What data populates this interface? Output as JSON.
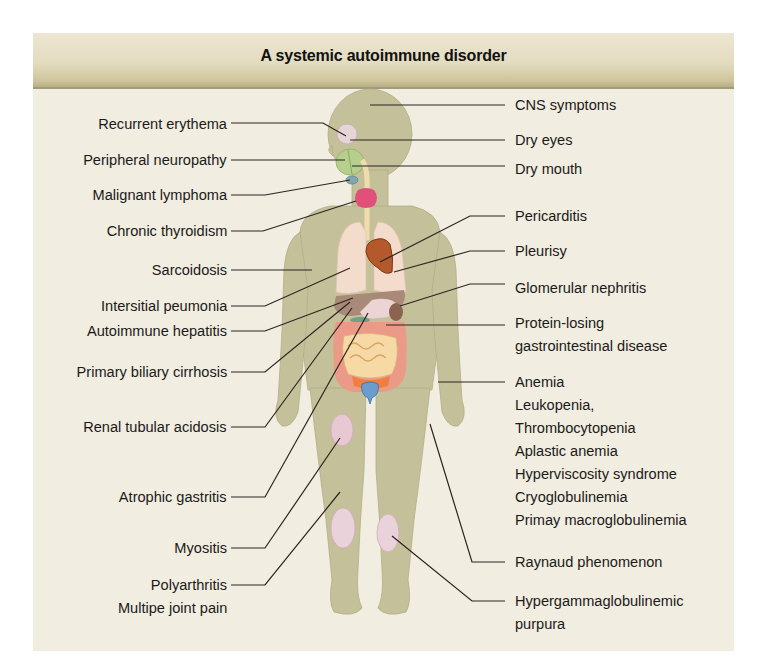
{
  "title": "A systemic autoimmune disorder",
  "colors": {
    "panel_bg": "#f1ede0",
    "header_band": "#e3dcc0",
    "body_skin": "#c4c09a",
    "lungs": "#f3dccb",
    "heart": "#b4592c",
    "thyroid": "#e0507a",
    "salivary_gland": "#b7cf8c",
    "liver": "#a98a78",
    "stomach": "#ecd4d4",
    "intestine_frame": "#ec9a88",
    "small_intestine": "#f6d9a4",
    "bladder": "#6b9ccf",
    "joint_patch": "#e8c8d2",
    "leader_line": "#2a2520"
  },
  "labels_left": [
    {
      "text": "Recurrent erythema"
    },
    {
      "text": "Peripheral neuropathy"
    },
    {
      "text": "Malignant lymphoma"
    },
    {
      "text": "Chronic thyroidism"
    },
    {
      "text": "Sarcoidosis"
    },
    {
      "text": "Intersitial peumonia"
    },
    {
      "text": "Autoimmune hepatitis"
    },
    {
      "text": "Primary biliary cirrhosis"
    },
    {
      "text": "Renal tubular acidosis"
    },
    {
      "text": "Atrophic gastritis"
    },
    {
      "text": "Myositis"
    },
    {
      "text": "Polyarthritis"
    },
    {
      "text": "Multipe joint pain"
    }
  ],
  "labels_right": [
    {
      "text": "CNS symptoms"
    },
    {
      "text": "Dry eyes"
    },
    {
      "text": "Dry mouth"
    },
    {
      "text": "Pericarditis"
    },
    {
      "text": "Pleurisy"
    },
    {
      "text": "Glomerular nephritis"
    },
    {
      "text": "Protein-losing"
    },
    {
      "text": "gastrointestinal disease"
    },
    {
      "text": "Anemia"
    },
    {
      "text": "Leukopenia,"
    },
    {
      "text": "Thrombocytopenia"
    },
    {
      "text": "Aplastic anemia"
    },
    {
      "text": "Hyperviscosity syndrome"
    },
    {
      "text": "Cryoglobulinemia"
    },
    {
      "text": "Primay macroglobulinemia"
    },
    {
      "text": "Raynaud phenomenon"
    },
    {
      "text": "Hypergammaglobulinemic"
    },
    {
      "text": "purpura"
    }
  ]
}
